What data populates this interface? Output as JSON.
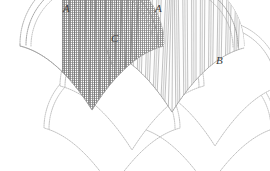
{
  "figure": {
    "type": "line-diagram",
    "background_color": "#ffffff",
    "stroke_color": "#9a9a9a",
    "stroke_color_dark": "#6e6e6e",
    "label_color": "#3c3c3c",
    "line_style": "dotted",
    "labels": [
      {
        "id": "a-left",
        "text": "A",
        "x": 63,
        "y": 3,
        "points_to": "crest of left shaded fan"
      },
      {
        "id": "a-right",
        "text": "A",
        "x": 155,
        "y": 3,
        "points_to": "crest of right fluted fan"
      },
      {
        "id": "c",
        "text": "C",
        "x": 111,
        "y": 33,
        "points_to": "valley notch between the two fans"
      },
      {
        "id": "b",
        "text": "B",
        "x": 216,
        "y": 55,
        "points_to": "outer rim border of right fan"
      }
    ],
    "fans": [
      {
        "id": "fan-top-left",
        "row": 1,
        "fill": "grid-mesh",
        "fill_label": "fine cross-hatched mesh",
        "has_rim": true,
        "cx": 92,
        "cy": 98,
        "r": 72
      },
      {
        "id": "fan-top-right",
        "row": 1,
        "fill": "vertical-flute",
        "fill_label": "vertical fluting / ribs",
        "has_rim": true,
        "cx": 172,
        "cy": 100,
        "r": 72
      },
      {
        "id": "fan-mid-center",
        "row": 2,
        "fill": "none",
        "fill_label": "outline only",
        "has_rim": true,
        "cx": 132,
        "cy": 150,
        "r": 72
      },
      {
        "id": "fan-mid-right",
        "row": 2,
        "fill": "none",
        "fill_label": "outline only",
        "has_rim": true,
        "cx": 215,
        "cy": 150,
        "r": 66
      },
      {
        "id": "fan-bottom-left",
        "row": 3,
        "fill": "none",
        "fill_label": "outline only",
        "has_rim": true,
        "cx": 112,
        "cy": 196,
        "r": 68
      },
      {
        "id": "fan-bottom-right",
        "row": 3,
        "fill": "none",
        "fill_label": "outline only",
        "has_rim": true,
        "cx": 208,
        "cy": 196,
        "r": 68
      }
    ],
    "counts": {
      "flute_lines": 34,
      "mesh_columns": 15
    }
  }
}
